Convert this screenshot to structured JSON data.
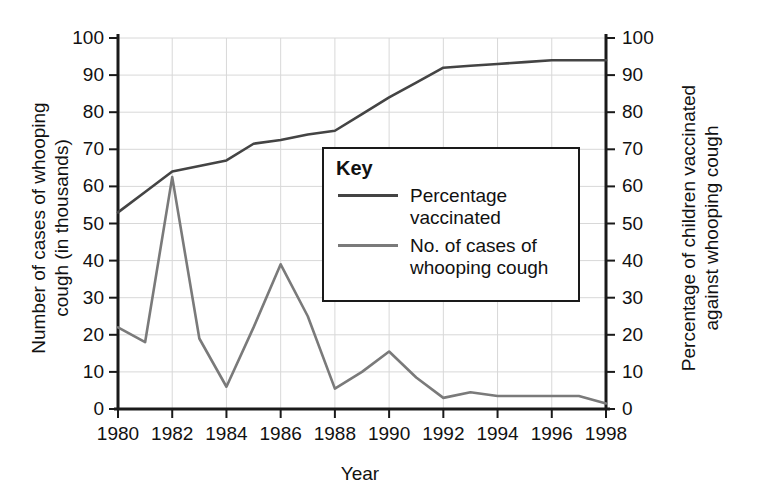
{
  "chart_data": {
    "type": "line",
    "title": "",
    "xlabel": "Year",
    "ylabel": "Number of cases of whooping\ncough (in thousands)",
    "ylabel_right": "Percentage of children vaccinated\nagainst whooping cough",
    "xlim": [
      1980,
      1998
    ],
    "ylim": [
      0,
      100
    ],
    "ylim_right": [
      0,
      100
    ],
    "grid": true,
    "legend_position": "inside-center",
    "x": [
      1980,
      1981,
      1982,
      1983,
      1984,
      1985,
      1986,
      1987,
      1988,
      1989,
      1990,
      1991,
      1992,
      1993,
      1994,
      1995,
      1996,
      1997,
      1998
    ],
    "xticks": [
      "1980",
      "1982",
      "1984",
      "1986",
      "1988",
      "1990",
      "1992",
      "1994",
      "1996",
      "1998"
    ],
    "yticks": [
      "0",
      "10",
      "20",
      "30",
      "40",
      "50",
      "60",
      "70",
      "80",
      "90",
      "100"
    ],
    "yticks_right": [
      "0",
      "10",
      "20",
      "30",
      "40",
      "50",
      "60",
      "70",
      "80",
      "90",
      "100"
    ],
    "series": [
      {
        "name": "Percentage vaccinated",
        "axis": "right",
        "color": "#444444",
        "values": [
          53,
          58.5,
          64,
          65.5,
          67,
          71.5,
          72.5,
          74,
          75,
          79.5,
          84,
          88,
          92,
          92.5,
          93,
          93.5,
          94,
          94,
          94
        ]
      },
      {
        "name": "No. of cases of whooping cough",
        "axis": "left",
        "color": "#7a7a7a",
        "values": [
          22,
          18,
          62.5,
          19,
          6,
          22,
          39,
          25,
          5.5,
          10,
          15.5,
          8.5,
          3,
          4.5,
          3.5,
          3.5,
          3.5,
          3.5,
          1.5
        ]
      }
    ]
  },
  "legend": {
    "title": "Key",
    "items": [
      {
        "label": "Percentage\nvaccinated",
        "color": "#444444"
      },
      {
        "label": "No. of cases of\nwhooping cough",
        "color": "#7a7a7a"
      }
    ]
  },
  "axes": {
    "left_title": "Number of cases of whooping\ncough (in thousands)",
    "right_title": "Percentage of children vaccinated\nagainst whooping cough",
    "bottom_title": "Year"
  },
  "colors": {
    "axis": "#1a1a1a",
    "grid": "#d8d8d8",
    "vaccinated_line": "#444444",
    "cases_line": "#7a7a7a",
    "background": "#ffffff"
  }
}
